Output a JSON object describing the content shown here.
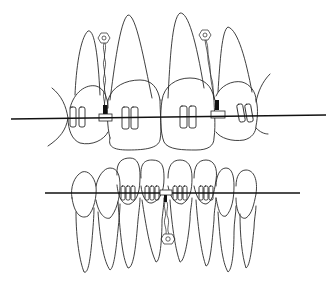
{
  "figure": {
    "title": "Orthodontic braces with archwire and elastic chain traction",
    "upper_arch": {
      "label": "Upper arch",
      "teeth_count": 4,
      "archwire": {
        "x1": 11,
        "y1": 119,
        "x2": 326,
        "y2": 115
      },
      "attachments": [
        {
          "label": "Left traction attachment",
          "bracket_x": 106,
          "bracket_y": 118,
          "anchor_x": 104,
          "anchor_y": 38
        },
        {
          "label": "Right traction attachment",
          "bracket_x": 218,
          "bracket_y": 115,
          "anchor_x": 205,
          "anchor_y": 35
        }
      ]
    },
    "lower_arch": {
      "label": "Lower arch",
      "teeth_count": 8,
      "archwire": {
        "x1": 45,
        "y1": 193,
        "x2": 300,
        "y2": 193
      },
      "attachments": [
        {
          "label": "Lower traction attachment",
          "bracket_x": 166,
          "bracket_y": 193,
          "anchor_x": 168,
          "anchor_y": 239
        }
      ]
    },
    "colors": {
      "line": "#2a2a2a",
      "background": "#ffffff"
    }
  }
}
